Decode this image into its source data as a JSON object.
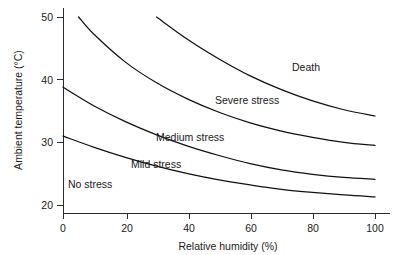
{
  "chart_data": {
    "type": "line",
    "title": "",
    "xlabel": "Relative humidity (%)",
    "ylabel": "Ambient temperature (°C)",
    "xlim": [
      0,
      100
    ],
    "ylim": [
      20,
      50
    ],
    "xticks": [
      0,
      20,
      40,
      60,
      80,
      100
    ],
    "yticks": [
      20,
      30,
      40,
      50
    ],
    "xtick_labels": [
      "0",
      "20",
      "40",
      "60",
      "80",
      "100"
    ],
    "ytick_labels": [
      "20",
      "30",
      "40",
      "50"
    ],
    "grid": false,
    "legend": "none",
    "annotations": [
      {
        "text": "Death",
        "x": 72,
        "y": 43.5
      },
      {
        "text": "Severe stress",
        "x": 47,
        "y": 38.0
      },
      {
        "text": "Medium stress",
        "x": 40,
        "y": 32.0
      },
      {
        "text": "Mild stress",
        "x": 28,
        "y": 27.8
      },
      {
        "text": "No stress",
        "x": 6,
        "y": 24.3
      }
    ],
    "series": [
      {
        "name": "Death threshold",
        "x": [
          30,
          40,
          50,
          60,
          70,
          80,
          90,
          100
        ],
        "y": [
          50.0,
          46.4,
          43.3,
          40.6,
          38.4,
          36.6,
          35.2,
          34.2
        ]
      },
      {
        "name": "Severe stress threshold",
        "x": [
          5,
          10,
          20,
          30,
          40,
          50,
          60,
          70,
          80,
          90,
          100
        ],
        "y": [
          50.0,
          47.2,
          42.8,
          39.5,
          36.9,
          34.8,
          33.1,
          31.8,
          30.8,
          30.0,
          29.5
        ]
      },
      {
        "name": "Medium stress threshold",
        "x": [
          0,
          10,
          20,
          30,
          40,
          50,
          60,
          70,
          80,
          90,
          100
        ],
        "y": [
          38.8,
          35.8,
          33.3,
          31.2,
          29.4,
          27.9,
          26.6,
          25.6,
          24.9,
          24.4,
          24.1
        ]
      },
      {
        "name": "Mild stress threshold",
        "x": [
          0,
          10,
          20,
          30,
          40,
          50,
          60,
          70,
          80,
          90,
          100
        ],
        "y": [
          31.0,
          29.2,
          27.6,
          26.2,
          25.0,
          24.0,
          23.2,
          22.5,
          22.0,
          21.6,
          21.3
        ]
      }
    ]
  },
  "axes": {
    "y_title": "Ambient temperature (°C)",
    "x_title": "Relative humidity (%)",
    "y_ticks": [
      {
        "label": "50"
      },
      {
        "label": "40"
      },
      {
        "label": "30"
      },
      {
        "label": "20"
      }
    ],
    "x_ticks": [
      {
        "label": "0"
      },
      {
        "label": "20"
      },
      {
        "label": "40"
      },
      {
        "label": "60"
      },
      {
        "label": "80"
      },
      {
        "label": "100"
      }
    ]
  },
  "zones": [
    {
      "label": "Death"
    },
    {
      "label": "Severe stress"
    },
    {
      "label": "Medium stress"
    },
    {
      "label": "Mild stress"
    },
    {
      "label": "No stress"
    }
  ],
  "colors": {
    "curve": "#111111",
    "axis": "#2b2b2b",
    "text": "#1a1a1a",
    "background": "#ffffff"
  }
}
